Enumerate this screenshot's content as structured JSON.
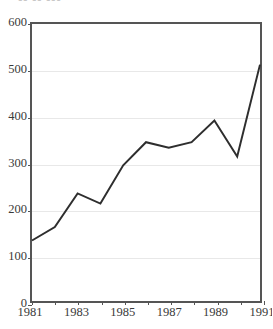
{
  "figure": {
    "title_partial": "▪▪ ▪▪ ▪▪▪",
    "background_color": "#ffffff",
    "frame_color": "#555555",
    "gridline_color": "#e8e8e8",
    "line_color": "#2e2e2e"
  },
  "chart_data": {
    "type": "line",
    "title": "",
    "xlabel": "",
    "ylabel": "",
    "x": [
      1981,
      1982,
      1983,
      1984,
      1985,
      1986,
      1987,
      1988,
      1989,
      1990,
      1991
    ],
    "values": [
      131,
      160,
      233,
      211,
      294,
      344,
      332,
      344,
      391,
      313,
      512
    ],
    "series": [
      {
        "name": "series-1",
        "values": [
          131,
          160,
          233,
          211,
          294,
          344,
          332,
          344,
          391,
          313,
          512
        ]
      }
    ],
    "xlim": [
      1981,
      1991
    ],
    "ylim": [
      0,
      600
    ],
    "ytick_labels": [
      "0",
      "100",
      "200",
      "300",
      "400",
      "500",
      "600"
    ],
    "ytick_values": [
      0,
      100,
      200,
      300,
      400,
      500,
      600
    ],
    "xtick_labels": [
      "1981",
      "1983",
      "1985",
      "1987",
      "1989",
      "1991"
    ],
    "xtick_values": [
      1981,
      1983,
      1985,
      1987,
      1989,
      1991
    ],
    "xtick_minor_values": [
      1982,
      1984,
      1986,
      1988,
      1990
    ],
    "grid": "horizontal",
    "legend": "none",
    "markers": "none"
  }
}
